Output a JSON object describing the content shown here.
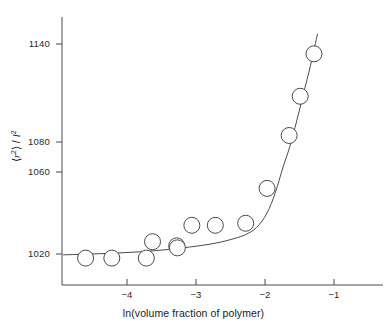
{
  "chart_data": {
    "type": "scatter",
    "title": "",
    "xlabel": "ln(volume fraction of polymer)",
    "ylabel": "⟨r²⟩ / l²",
    "ylabel_parts": {
      "open": "⟨",
      "sym_r": "r",
      "sup2a": "2",
      "close": "⟩",
      "slash": " / ",
      "sym_l": "l",
      "sup2b": "2"
    },
    "xlim": [
      -4.95,
      -0.65
    ],
    "ylim": [
      1009,
      1151
    ],
    "xticks": [
      -4,
      -3,
      -2,
      -1
    ],
    "xtick_labels": [
      "−4",
      "−3",
      "−2",
      "−1"
    ],
    "yticks": [
      1020,
      1060,
      1080,
      1140
    ],
    "ytick_labels": [
      "1020",
      "1060",
      "1080",
      "1140"
    ],
    "grid": false,
    "legend": null,
    "marker": {
      "shape": "open-circle",
      "radius_px": 8,
      "facecolor": "#ffffff",
      "edgecolor": "#4a4a4a"
    },
    "line": {
      "style": "solid",
      "color": "#4a4a4a",
      "width": 1
    },
    "points": [
      {
        "x": -4.6,
        "y": 1018
      },
      {
        "x": -4.22,
        "y": 1018
      },
      {
        "x": -3.72,
        "y": 1018
      },
      {
        "x": -3.63,
        "y": 1026
      },
      {
        "x": -3.28,
        "y": 1024
      },
      {
        "x": -3.27,
        "y": 1023
      },
      {
        "x": -3.06,
        "y": 1034
      },
      {
        "x": -2.72,
        "y": 1034
      },
      {
        "x": -2.28,
        "y": 1035
      },
      {
        "x": -1.97,
        "y": 1052
      },
      {
        "x": -1.65,
        "y": 1084
      },
      {
        "x": -1.49,
        "y": 1108
      },
      {
        "x": -1.29,
        "y": 1134
      }
    ],
    "curve": [
      {
        "x": -4.92,
        "y": 1019.6
      },
      {
        "x": -4.6,
        "y": 1019.9
      },
      {
        "x": -4.2,
        "y": 1020.4
      },
      {
        "x": -3.8,
        "y": 1021.1
      },
      {
        "x": -3.4,
        "y": 1022.2
      },
      {
        "x": -3.0,
        "y": 1023.8
      },
      {
        "x": -2.7,
        "y": 1025.4
      },
      {
        "x": -2.45,
        "y": 1027.5
      },
      {
        "x": -2.28,
        "y": 1029.5
      },
      {
        "x": -2.12,
        "y": 1033.0
      },
      {
        "x": -1.97,
        "y": 1040.0
      },
      {
        "x": -1.85,
        "y": 1050.0
      },
      {
        "x": -1.74,
        "y": 1063.0
      },
      {
        "x": -1.64,
        "y": 1077.0
      },
      {
        "x": -1.54,
        "y": 1093.0
      },
      {
        "x": -1.44,
        "y": 1110.0
      },
      {
        "x": -1.34,
        "y": 1127.0
      },
      {
        "x": -1.24,
        "y": 1146.0
      }
    ]
  }
}
